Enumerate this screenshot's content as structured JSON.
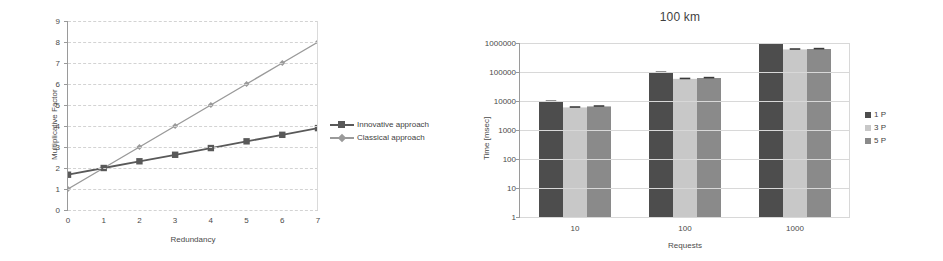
{
  "figure": {
    "panels": [
      "multiplicative-factor-line-chart",
      "time-vs-requests-bar-chart"
    ]
  },
  "left_panel": {
    "legend": [
      {
        "label": "Innovative approach",
        "color": "#595959",
        "marker": "square"
      },
      {
        "label": "Classical approach",
        "color": "#9a9a9a",
        "marker": "diamond"
      }
    ]
  },
  "right_panel": {
    "legend": [
      {
        "label": "1 P",
        "color": "#4d4d4d"
      },
      {
        "label": "3 P",
        "color": "#c8c8c8"
      },
      {
        "label": "5 P",
        "color": "#8a8a8a"
      }
    ]
  },
  "chart_data": [
    {
      "id": "multiplicative-factor-line-chart",
      "type": "line",
      "title": "",
      "xlabel": "Redundancy",
      "ylabel": "Multiplicative Factor",
      "x": [
        0,
        1,
        2,
        3,
        4,
        5,
        6,
        7
      ],
      "xticks": [
        "0",
        "1",
        "2",
        "3",
        "4",
        "5",
        "6",
        "7"
      ],
      "yticks": [
        "0",
        "1",
        "2",
        "3",
        "4",
        "5",
        "6",
        "7",
        "8",
        "9"
      ],
      "xlim": [
        0,
        7
      ],
      "ylim": [
        0,
        9
      ],
      "grid": true,
      "legend_position": "right",
      "series": [
        {
          "name": "Innovative approach",
          "color": "#595959",
          "marker": "square",
          "values": [
            1.68,
            2.0,
            2.32,
            2.63,
            2.95,
            3.27,
            3.58,
            3.9
          ]
        },
        {
          "name": "Classical approach",
          "color": "#9a9a9a",
          "marker": "diamond",
          "values": [
            1.0,
            2.0,
            3.0,
            4.0,
            5.0,
            6.0,
            7.0,
            8.0
          ]
        }
      ]
    },
    {
      "id": "time-vs-requests-bar-chart",
      "type": "bar",
      "title": "100 km",
      "xlabel": "Requests",
      "ylabel": "Time [msec]",
      "categories": [
        "10",
        "100",
        "1000"
      ],
      "yticks": [
        "1",
        "10",
        "100",
        "1000",
        "10000",
        "100000",
        "1000000"
      ],
      "yscale": "log",
      "ylim": [
        1,
        1000000
      ],
      "grid": true,
      "legend_position": "right",
      "series": [
        {
          "name": "1 P",
          "color": "#4d4d4d",
          "values": [
            9500,
            95000,
            1000000
          ]
        },
        {
          "name": "3 P",
          "color": "#c8c8c8",
          "values": [
            6000,
            58000,
            600000
          ]
        },
        {
          "name": "5 P",
          "color": "#8a8a8a",
          "values": [
            6500,
            62000,
            620000
          ]
        }
      ]
    }
  ]
}
